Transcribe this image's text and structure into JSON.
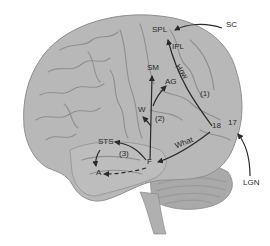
{
  "diagram": {
    "colors": {
      "brain_fill": "#b8b8b8",
      "brain_sulci": "#8f8f8f",
      "cerebellum_fill": "#a9a9a9",
      "arrow": "#2a2a2a",
      "label": "#2a2a2a",
      "background": "#ffffff"
    },
    "labels": {
      "sc": "SC",
      "spl": "SPL",
      "ipl": "IPL",
      "sm": "SM",
      "ag": "AG",
      "how": "How",
      "path1": "(1)",
      "w": "W",
      "path2": "(2)",
      "area18": "18",
      "area17": "17",
      "what": "What",
      "sts": "STS",
      "path3": "(3)",
      "f": "F",
      "a": "A",
      "lgn": "LGN"
    },
    "pathways": [
      {
        "from": "SC",
        "to": "SPL",
        "style": "solid"
      },
      {
        "from": "LGN",
        "to": "17",
        "style": "solid"
      },
      {
        "from": "18",
        "to": "SPL",
        "style": "solid",
        "name": "How",
        "number": "(1)"
      },
      {
        "from": "18",
        "to": "F",
        "style": "solid",
        "name": "What"
      },
      {
        "from": "F",
        "to": "SM",
        "style": "solid",
        "number": "(2)"
      },
      {
        "from": "F",
        "to": "AG",
        "style": "solid"
      },
      {
        "from": "F",
        "to": "W",
        "style": "solid"
      },
      {
        "from": "F",
        "to": "STS",
        "style": "solid",
        "number": "(3)"
      },
      {
        "from": "STS",
        "to": "A",
        "style": "solid"
      },
      {
        "from": "F",
        "to": "A",
        "style": "dashed"
      }
    ]
  }
}
